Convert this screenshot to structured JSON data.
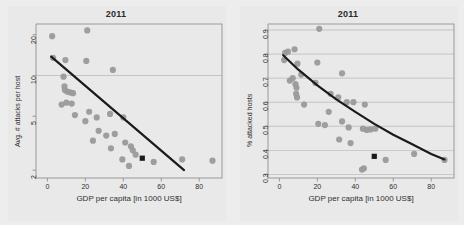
{
  "figure": {
    "background_color": "#ededed",
    "panel_background": "#e9e9e9",
    "point_color": "#9a9a9a",
    "highlight_color": "#1a1a1a",
    "trend_color": "#1a1a1a",
    "grid_color": "#8d9aa6",
    "axis_color": "#7a7a7a",
    "panel_count": 2
  },
  "chart_data": [
    {
      "type": "scatter",
      "panel": "left",
      "title": "2011",
      "xlabel": "GDP per capita [in 1000 US$]",
      "ylabel": "Avg. # attacks per host",
      "xlim": [
        -6,
        92
      ],
      "ylim": [
        1.75,
        24
      ],
      "yscale": "log",
      "xscale": "linear",
      "xticks": [
        0,
        20,
        40,
        60,
        80
      ],
      "xtick_labels": [
        "0",
        "20",
        "40",
        "60",
        "80"
      ],
      "yticks": [
        2,
        5,
        10,
        20
      ],
      "ytick_labels": [
        "2",
        "5",
        "10",
        "20"
      ],
      "grid": "horizontal-only",
      "gridlines_y": [
        10
      ],
      "legend": "none",
      "points": [
        {
          "x": 2.5,
          "y": 19.5
        },
        {
          "x": 21.0,
          "y": 21.5
        },
        {
          "x": 3.0,
          "y": 13.5
        },
        {
          "x": 9.5,
          "y": 13.0
        },
        {
          "x": 20.5,
          "y": 12.8
        },
        {
          "x": 34.5,
          "y": 11.0
        },
        {
          "x": 8.5,
          "y": 9.8
        },
        {
          "x": 9.0,
          "y": 8.3
        },
        {
          "x": 9.2,
          "y": 7.8
        },
        {
          "x": 10.5,
          "y": 7.6
        },
        {
          "x": 12.0,
          "y": 7.5
        },
        {
          "x": 13.5,
          "y": 7.4
        },
        {
          "x": 10.0,
          "y": 6.3
        },
        {
          "x": 12.8,
          "y": 6.2
        },
        {
          "x": 7.5,
          "y": 6.1
        },
        {
          "x": 14.5,
          "y": 5.1
        },
        {
          "x": 22.0,
          "y": 5.4
        },
        {
          "x": 20.0,
          "y": 4.6
        },
        {
          "x": 26.0,
          "y": 4.9
        },
        {
          "x": 33.0,
          "y": 5.2
        },
        {
          "x": 40.0,
          "y": 4.9
        },
        {
          "x": 27.0,
          "y": 3.9
        },
        {
          "x": 31.0,
          "y": 3.6
        },
        {
          "x": 35.5,
          "y": 3.7
        },
        {
          "x": 24.0,
          "y": 3.3
        },
        {
          "x": 33.5,
          "y": 2.9
        },
        {
          "x": 41.0,
          "y": 3.2
        },
        {
          "x": 44.0,
          "y": 3.0
        },
        {
          "x": 45.0,
          "y": 2.8
        },
        {
          "x": 46.5,
          "y": 2.6
        },
        {
          "x": 39.5,
          "y": 2.4
        },
        {
          "x": 43.0,
          "y": 2.15
        },
        {
          "x": 56.0,
          "y": 2.3
        },
        {
          "x": 71.0,
          "y": 2.4
        },
        {
          "x": 87.0,
          "y": 2.35
        }
      ],
      "highlight_point": {
        "x": 50.0,
        "y": 2.45,
        "marker": "square"
      },
      "trend_line": {
        "type": "linear",
        "x_start": 2.0,
        "y_start": 13.8,
        "x_end": 72.0,
        "y_end": 2.0
      }
    },
    {
      "type": "scatter",
      "panel": "right",
      "title": "2011",
      "xlabel": "GDP per capita [in 1000 US$]",
      "ylabel": "% attacked hosts",
      "xlim": [
        -6,
        92
      ],
      "ylim": [
        0.285,
        0.925
      ],
      "yscale": "linear",
      "xscale": "linear",
      "xticks": [
        0,
        20,
        40,
        60,
        80
      ],
      "xtick_labels": [
        "0",
        "20",
        "40",
        "60",
        "80"
      ],
      "yticks": [
        0.3,
        0.4,
        0.5,
        0.6,
        0.7,
        0.8,
        0.9
      ],
      "ytick_labels": [
        "0.3",
        "0.4",
        "0.5",
        "0.6",
        "0.7",
        "0.8",
        "0.9"
      ],
      "grid": "horizontal-only",
      "gridlines_y": [
        0.3,
        0.4,
        0.5,
        0.6,
        0.7,
        0.8,
        0.9
      ],
      "legend": "none",
      "points": [
        {
          "x": 21.0,
          "y": 0.905
        },
        {
          "x": 3.0,
          "y": 0.805
        },
        {
          "x": 4.5,
          "y": 0.81
        },
        {
          "x": 8.0,
          "y": 0.82
        },
        {
          "x": 2.5,
          "y": 0.775
        },
        {
          "x": 9.5,
          "y": 0.76
        },
        {
          "x": 20.0,
          "y": 0.765
        },
        {
          "x": 7.0,
          "y": 0.7
        },
        {
          "x": 11.5,
          "y": 0.715
        },
        {
          "x": 5.5,
          "y": 0.69
        },
        {
          "x": 8.5,
          "y": 0.675
        },
        {
          "x": 9.0,
          "y": 0.66
        },
        {
          "x": 19.0,
          "y": 0.68
        },
        {
          "x": 33.0,
          "y": 0.72
        },
        {
          "x": 8.8,
          "y": 0.635
        },
        {
          "x": 9.3,
          "y": 0.62
        },
        {
          "x": 27.0,
          "y": 0.635
        },
        {
          "x": 31.0,
          "y": 0.62
        },
        {
          "x": 13.0,
          "y": 0.59
        },
        {
          "x": 39.0,
          "y": 0.6
        },
        {
          "x": 45.0,
          "y": 0.59
        },
        {
          "x": 26.0,
          "y": 0.56
        },
        {
          "x": 35.5,
          "y": 0.6
        },
        {
          "x": 20.5,
          "y": 0.51
        },
        {
          "x": 24.0,
          "y": 0.505
        },
        {
          "x": 33.0,
          "y": 0.52
        },
        {
          "x": 36.5,
          "y": 0.495
        },
        {
          "x": 44.0,
          "y": 0.49
        },
        {
          "x": 46.0,
          "y": 0.485
        },
        {
          "x": 48.0,
          "y": 0.487
        },
        {
          "x": 50.5,
          "y": 0.49
        },
        {
          "x": 31.5,
          "y": 0.445
        },
        {
          "x": 37.5,
          "y": 0.43
        },
        {
          "x": 43.5,
          "y": 0.32
        },
        {
          "x": 44.5,
          "y": 0.325
        },
        {
          "x": 56.0,
          "y": 0.36
        },
        {
          "x": 71.0,
          "y": 0.385
        },
        {
          "x": 87.0,
          "y": 0.36
        }
      ],
      "highlight_point": {
        "x": 50.0,
        "y": 0.375,
        "marker": "square"
      },
      "trend_curve": {
        "type": "decaying",
        "x": [
          2,
          10,
          20,
          30,
          40,
          50,
          60,
          70,
          80,
          87
        ],
        "y": [
          0.795,
          0.735,
          0.67,
          0.612,
          0.56,
          0.51,
          0.465,
          0.425,
          0.385,
          0.362
        ]
      }
    }
  ]
}
